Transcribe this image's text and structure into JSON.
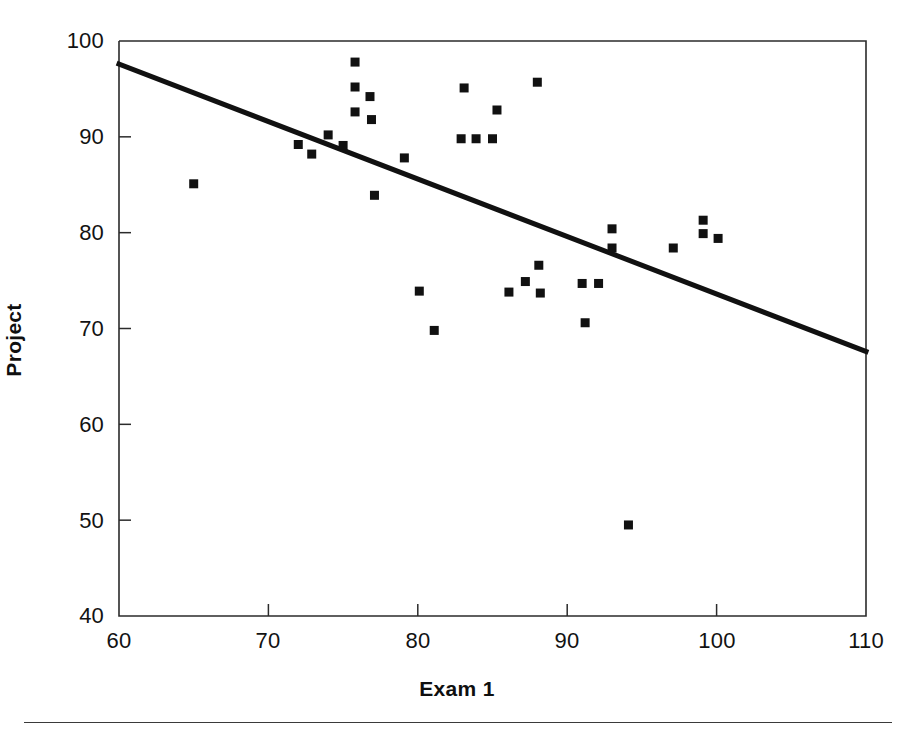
{
  "chart_data": {
    "type": "scatter",
    "title": "",
    "xlabel": "Exam 1",
    "ylabel": "Project",
    "xlim": [
      60,
      110
    ],
    "ylim": [
      40,
      100
    ],
    "xticks": [
      60,
      70,
      80,
      90,
      100,
      110
    ],
    "yticks": [
      40,
      50,
      60,
      70,
      80,
      90,
      100
    ],
    "grid": false,
    "legend": false,
    "marker": "filled-square",
    "marker_color": "#111111",
    "line_color": "#111111",
    "axis_color": "#2b2b2b",
    "background_color": "#ffffff",
    "points": [
      {
        "x": 65.0,
        "y": 85.1
      },
      {
        "x": 72.0,
        "y": 89.2
      },
      {
        "x": 72.9,
        "y": 88.2
      },
      {
        "x": 74.0,
        "y": 90.2
      },
      {
        "x": 75.0,
        "y": 89.1
      },
      {
        "x": 75.8,
        "y": 97.8
      },
      {
        "x": 75.8,
        "y": 95.2
      },
      {
        "x": 75.8,
        "y": 92.6
      },
      {
        "x": 76.8,
        "y": 94.2
      },
      {
        "x": 76.9,
        "y": 91.8
      },
      {
        "x": 77.1,
        "y": 83.9
      },
      {
        "x": 79.1,
        "y": 87.8
      },
      {
        "x": 80.1,
        "y": 73.9
      },
      {
        "x": 81.1,
        "y": 69.8
      },
      {
        "x": 83.1,
        "y": 95.1
      },
      {
        "x": 82.9,
        "y": 89.8
      },
      {
        "x": 83.9,
        "y": 89.8
      },
      {
        "x": 85.0,
        "y": 89.8
      },
      {
        "x": 85.3,
        "y": 92.8
      },
      {
        "x": 86.1,
        "y": 73.8
      },
      {
        "x": 87.2,
        "y": 74.9
      },
      {
        "x": 88.0,
        "y": 95.7
      },
      {
        "x": 88.1,
        "y": 76.6
      },
      {
        "x": 88.2,
        "y": 73.7
      },
      {
        "x": 91.0,
        "y": 74.7
      },
      {
        "x": 91.2,
        "y": 70.6
      },
      {
        "x": 92.1,
        "y": 74.7
      },
      {
        "x": 93.0,
        "y": 80.4
      },
      {
        "x": 93.0,
        "y": 78.4
      },
      {
        "x": 94.1,
        "y": 49.5
      },
      {
        "x": 97.1,
        "y": 78.4
      },
      {
        "x": 99.1,
        "y": 81.3
      },
      {
        "x": 99.1,
        "y": 79.9
      },
      {
        "x": 100.1,
        "y": 79.4
      }
    ],
    "trendline": {
      "type": "linear-fit",
      "x_start": 60,
      "y_start": 97.6,
      "x_end": 110,
      "y_end": 67.6,
      "slope": -0.6,
      "intercept": 133.6,
      "width_px": 5
    }
  },
  "axes": {
    "x_tick_labels": [
      "60",
      "70",
      "80",
      "90",
      "100",
      "110"
    ],
    "y_tick_labels": [
      "100",
      "90",
      "80",
      "70",
      "60",
      "50",
      "40"
    ],
    "x_axis_title": "Exam 1",
    "y_axis_title": "Project"
  }
}
